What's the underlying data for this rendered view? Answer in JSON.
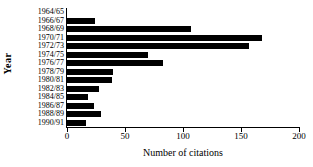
{
  "chart_data": {
    "type": "bar",
    "orientation": "horizontal",
    "title": "",
    "xlabel": "Number of citations",
    "ylabel": "Year",
    "categories": [
      "1964/65",
      "1966/67",
      "1968/69",
      "1970/71",
      "1972/73",
      "1974/75",
      "1976/77",
      "1978/79",
      "1980/81",
      "1982/83",
      "1984/85",
      "1986/87",
      "1988/89",
      "1990/91"
    ],
    "values": [
      0,
      24,
      107,
      168,
      157,
      70,
      83,
      40,
      39,
      28,
      18,
      23,
      29,
      16
    ],
    "xlim": [
      0,
      200
    ],
    "xticks": [
      0,
      50,
      100,
      150,
      200
    ],
    "xtick_labels": [
      "0",
      "50",
      "100",
      "150",
      "200"
    ],
    "grid": false,
    "legend": false,
    "bar_color": "#000000",
    "background_color": "#ffffff"
  }
}
